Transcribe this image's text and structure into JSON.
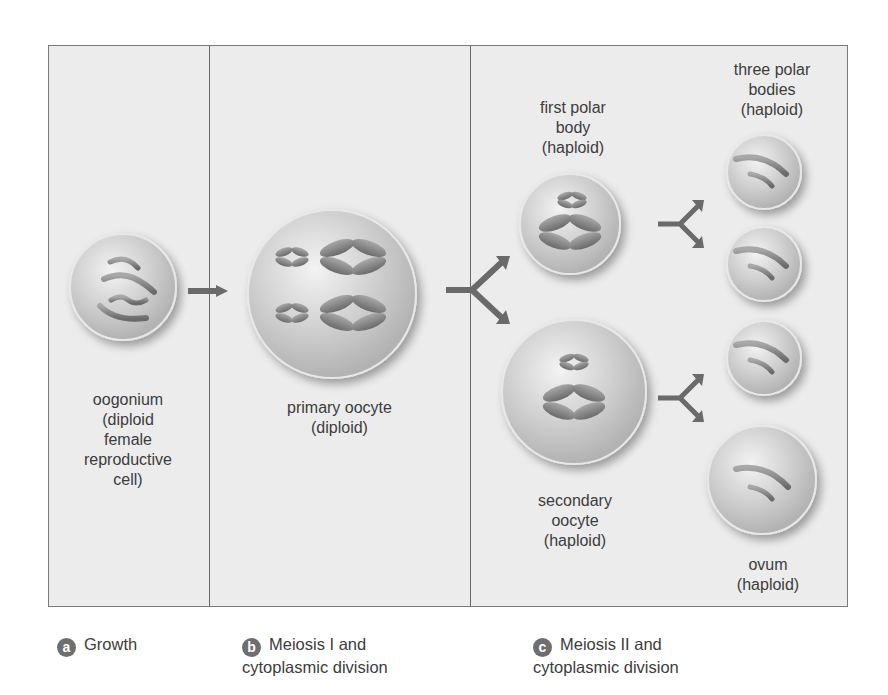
{
  "diagram": {
    "panels": [
      {
        "id": "a",
        "badge": "a",
        "caption_line1": "Growth",
        "caption_line2": ""
      },
      {
        "id": "b",
        "badge": "b",
        "caption_line1": "Meiosis I and",
        "caption_line2": "cytoplasmic division"
      },
      {
        "id": "c",
        "badge": "c",
        "caption_line1": "Meiosis II and",
        "caption_line2": "cytoplasmic division"
      }
    ],
    "cells": {
      "oogonium": {
        "label": "oogonium\n(diploid\nfemale\nreproductive\ncell)",
        "chromosomes": "4 rod chromosomes"
      },
      "primary_oocyte": {
        "label": "primary oocyte\n(diploid)",
        "chromosomes": "2 small + 2 large duplicated chromosomes"
      },
      "first_polar_body": {
        "label": "first polar\nbody\n(haploid)",
        "chromosomes": "1 small + 1 large duplicated chromosome"
      },
      "secondary_oocyte": {
        "label": "secondary\noocyte\n(haploid)",
        "chromosomes": "1 small + 1 large duplicated chromosome"
      },
      "three_polar_bodies": {
        "label": "three polar\nbodies\n(haploid)",
        "count": 3
      },
      "ovum": {
        "label": "ovum\n(haploid)"
      }
    },
    "arrows": [
      {
        "from": "oogonium",
        "to": "primary_oocyte",
        "type": "straight"
      },
      {
        "from": "primary_oocyte",
        "to": [
          "first_polar_body",
          "secondary_oocyte"
        ],
        "type": "split"
      },
      {
        "from": "first_polar_body",
        "to": [
          "polar_body_1",
          "polar_body_2"
        ],
        "type": "split"
      },
      {
        "from": "secondary_oocyte",
        "to": [
          "polar_body_3",
          "ovum"
        ],
        "type": "split"
      }
    ]
  }
}
